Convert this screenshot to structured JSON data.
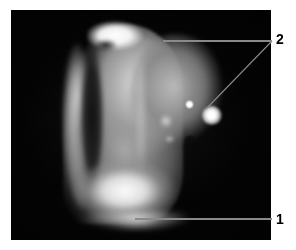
{
  "figure": {
    "kind": "photomicrograph",
    "caption_visible": false,
    "background_color": "#ffffff",
    "plate": {
      "name": "specimen-photograph",
      "border_color": "#ffffff",
      "background_color": "#000000",
      "x": 11,
      "y": 10,
      "width": 260,
      "height": 230
    },
    "subject": {
      "description": "brightly illuminated elongated specimen with rounded dome on a dark field",
      "specular_highlights": 2,
      "dark_inclusion": 1
    },
    "callouts": [
      {
        "id": "1",
        "label": "1",
        "name": "callout-label-1",
        "label_x": 276,
        "label_y": 212,
        "leaders": [
          {
            "name": "leader-line-1",
            "x1": 272,
            "y1": 219,
            "x2": 135,
            "y2": 219
          }
        ],
        "points_to": "bright substrate glow at base of specimen"
      },
      {
        "id": "2",
        "label": "2",
        "name": "callout-label-2",
        "label_x": 276,
        "label_y": 32,
        "leaders": [
          {
            "name": "leader-line-2-horizontal",
            "x1": 272,
            "y1": 41,
            "x2": 163,
            "y2": 41
          },
          {
            "name": "leader-line-2-diagonal",
            "x1": 272,
            "y1": 41,
            "x2": 206,
            "y2": 109
          }
        ],
        "points_to": "specular highlight on the domed surface"
      }
    ],
    "colors": {
      "page_background": "#ffffff",
      "plate_background": "#000000",
      "leader_line": "#808080",
      "label_text": "#000000",
      "specimen_bright": "#ffffff",
      "specimen_mid": "#9a9a9a",
      "specimen_shadow": "#1a1a1a"
    }
  }
}
